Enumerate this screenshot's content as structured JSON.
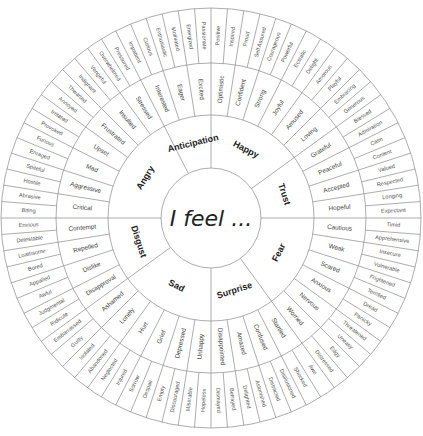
{
  "center_label": "I feel ...",
  "colors": {
    "line": "#8a8a8a",
    "text": "#444444",
    "background": "#ffffff"
  },
  "core": [
    {
      "label": "Happy",
      "groups": [
        {
          "label": "Optimistic",
          "outer": [
            "Positive",
            "Inspired"
          ]
        },
        {
          "label": "Confident",
          "outer": [
            "Proud",
            "Self Assured"
          ]
        },
        {
          "label": "Strong",
          "outer": [
            "Courageous",
            "Powerful"
          ]
        },
        {
          "label": "Joyful",
          "outer": [
            "Ecstatic",
            "Delight"
          ]
        },
        {
          "label": "Amused",
          "outer": [
            "Amorous",
            "Playful"
          ]
        },
        {
          "label": "Loving",
          "outer": [
            "Embracing",
            "Generous"
          ]
        }
      ]
    },
    {
      "label": "Trust",
      "groups": [
        {
          "label": "Grateful",
          "outer": [
            "Blessed",
            "Admiration"
          ]
        },
        {
          "label": "Peaceful",
          "outer": [
            "Calm",
            "Content"
          ]
        },
        {
          "label": "Accepted",
          "outer": [
            "Valued",
            "Respected"
          ]
        },
        {
          "label": "Hopeful",
          "outer": [
            "Longing",
            "Expectant"
          ]
        }
      ]
    },
    {
      "label": "Fear",
      "groups": [
        {
          "label": "Cautious",
          "outer": [
            "Timid",
            "Apprehensive"
          ]
        },
        {
          "label": "Weak",
          "outer": [
            "Insecure",
            "Vulnerable"
          ]
        },
        {
          "label": "Scared",
          "outer": [
            "Frightened",
            "Terrified"
          ]
        },
        {
          "label": "Anxious",
          "outer": [
            "Dread",
            "Panicky"
          ]
        },
        {
          "label": "Nervous",
          "outer": [
            "Threatened",
            "Uneasy"
          ]
        },
        {
          "label": "Worried",
          "outer": [
            "Edgy",
            "Distressed"
          ]
        }
      ]
    },
    {
      "label": "Surprise",
      "groups": [
        {
          "label": "Startled",
          "outer": [
            "Awe",
            "Shocked"
          ]
        },
        {
          "label": "Confused",
          "outer": [
            "Disillusioned",
            "Distracted"
          ]
        },
        {
          "label": "Amazed",
          "outer": [
            "Astonished",
            "Delighted"
          ]
        },
        {
          "label": "Disappointed",
          "outer": [
            "Betrayed",
            "Dismayed"
          ]
        }
      ]
    },
    {
      "label": "Sad",
      "groups": [
        {
          "label": "Unhappy",
          "outer": [
            "Hopeless",
            "Miserable"
          ]
        },
        {
          "label": "Depressed",
          "outer": [
            "Discouraged",
            "Empty"
          ]
        },
        {
          "label": "Grief",
          "outer": [
            "Despair",
            "Sorrow"
          ]
        },
        {
          "label": "Hurt",
          "outer": [
            "Injured",
            "Neglected"
          ]
        },
        {
          "label": "Lonely",
          "outer": [
            "Abandoned",
            "Isolated"
          ]
        },
        {
          "label": "Ashamed",
          "outer": [
            "Guilty",
            "Embarrassed"
          ]
        }
      ]
    },
    {
      "label": "Disgust",
      "groups": [
        {
          "label": "Disapproval",
          "outer": [
            "Ridicule",
            "Judgmental"
          ]
        },
        {
          "label": "Dislike",
          "outer": [
            "Awful",
            "Appalled"
          ]
        },
        {
          "label": "Repelled",
          "outer": [
            "Bored",
            "Loathsome"
          ]
        },
        {
          "label": "Contempt",
          "outer": [
            "Detestable",
            "Envious"
          ]
        }
      ]
    },
    {
      "label": "Angry",
      "groups": [
        {
          "label": "Critical",
          "outer": [
            "Biting",
            "Abrasive"
          ]
        },
        {
          "label": "Aggressive",
          "outer": [
            "Hostile",
            "Spiteful"
          ]
        },
        {
          "label": "Mad",
          "outer": [
            "Enraged",
            "Furious"
          ]
        },
        {
          "label": "Upset",
          "outer": [
            "Provoked",
            "Irritated"
          ]
        },
        {
          "label": "Frustrated",
          "outer": [
            "Annoyed",
            "Thwarted"
          ]
        },
        {
          "label": "Insulted",
          "outer": [
            "Indignant",
            "Vengeful"
          ]
        },
        {
          "label": "Stressed",
          "outer": [
            "Overwhelmed",
            "Pressured"
          ]
        }
      ]
    },
    {
      "label": "Anticipation",
      "groups": [
        {
          "label": "Interested",
          "outer": [
            "Impatient",
            "Curious"
          ]
        },
        {
          "label": "Eager",
          "outer": [
            "Enthusiastic",
            "Motivated"
          ]
        },
        {
          "label": "Excited",
          "outer": [
            "Energized",
            "Passionate"
          ]
        }
      ]
    }
  ]
}
